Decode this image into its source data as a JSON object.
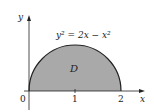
{
  "diagram": {
    "equation": "y² = 2x − x²",
    "region_label": "D",
    "axes": {
      "x_label": "x",
      "y_label": "y",
      "x_ticks": [
        "0",
        "1",
        "2"
      ]
    },
    "colors": {
      "region_fill": "#a9a9a9",
      "stroke": "#222222"
    }
  }
}
